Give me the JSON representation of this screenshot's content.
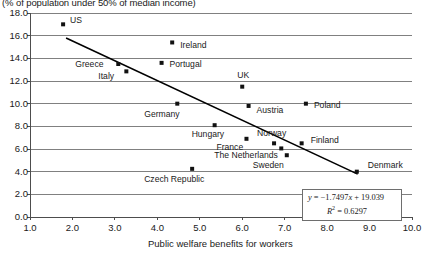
{
  "chart_data": {
    "type": "scatter",
    "title": "(% of population under 50% of median income)",
    "xlabel": "Public welfare benefits for workers",
    "ylabel": "",
    "xlim": [
      1.0,
      10.0
    ],
    "ylim": [
      0.0,
      18.0
    ],
    "xticks": [
      "1.0",
      "2.0",
      "3.0",
      "4.0",
      "5.0",
      "6.0",
      "7.0",
      "8.0",
      "9.0",
      "10.0"
    ],
    "yticks": [
      "0.0",
      "2.0",
      "4.0",
      "6.0",
      "8.0",
      "10.0",
      "12.0",
      "14.0",
      "16.0",
      "18.0"
    ],
    "grid": true,
    "legend": "none",
    "points": [
      {
        "label": "US",
        "x": 1.78,
        "y": 17.0,
        "label_dx": 7,
        "label_dy": -4
      },
      {
        "label": "Ireland",
        "x": 4.35,
        "y": 15.4,
        "label_dx": 8,
        "label_dy": 3
      },
      {
        "label": "Portugal",
        "x": 4.1,
        "y": 13.6,
        "label_dx": 8,
        "label_dy": 1
      },
      {
        "label": "Greece",
        "x": 3.08,
        "y": 13.5,
        "label_dx": -43,
        "label_dy": 0
      },
      {
        "label": "Italy",
        "x": 3.27,
        "y": 12.85,
        "label_dx": -28,
        "label_dy": 5
      },
      {
        "label": "UK",
        "x": 6.0,
        "y": 11.5,
        "label_dx": -5,
        "label_dy": -12
      },
      {
        "label": "Poland",
        "x": 7.5,
        "y": 10.0,
        "label_dx": 8,
        "label_dy": 1
      },
      {
        "label": "Germany",
        "x": 4.47,
        "y": 10.0,
        "label_dx": -33,
        "label_dy": 10
      },
      {
        "label": "Austria",
        "x": 6.15,
        "y": 9.8,
        "label_dx": 8,
        "label_dy": 4
      },
      {
        "label": "Hungary",
        "x": 5.35,
        "y": 8.1,
        "label_dx": -23,
        "label_dy": 9
      },
      {
        "label": "France",
        "x": 6.1,
        "y": 6.9,
        "label_dx": -30,
        "label_dy": 8
      },
      {
        "label": "Norway",
        "x": 6.75,
        "y": 6.5,
        "label_dx": -17,
        "label_dy": -10
      },
      {
        "label": "Finland",
        "x": 7.4,
        "y": 6.5,
        "label_dx": 9,
        "label_dy": -3
      },
      {
        "label": "The Netherlands",
        "x": 6.92,
        "y": 6.05,
        "label_dx": -67,
        "label_dy": 7
      },
      {
        "label": "Sweden",
        "x": 7.05,
        "y": 5.45,
        "label_dx": -34,
        "label_dy": 10
      },
      {
        "label": "Denmark",
        "x": 8.7,
        "y": 4.0,
        "label_dx": 11,
        "label_dy": -7
      },
      {
        "label": "Czech Republic",
        "x": 4.82,
        "y": 4.25,
        "label_dx": -48,
        "label_dy": 10
      }
    ],
    "trendline": {
      "slope": -1.7497,
      "intercept": 19.039,
      "x_start": 1.85,
      "x_end": 8.72,
      "equation_line1": "y = −1.7497x + 19.039",
      "equation_line2_base": "R",
      "equation_line2_sup": "2",
      "equation_line2_rest": " = 0.6297"
    }
  }
}
